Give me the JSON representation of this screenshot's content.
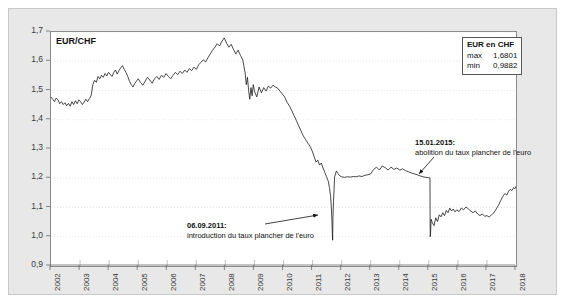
{
  "figure": {
    "series_label": "EUR/CHF",
    "background_panel_color": "#e8e8e8",
    "plot_background_color": "#ffffff",
    "line_color": "#1a1a1a",
    "grid_color": "#d9d9d9"
  },
  "legend": {
    "title": "EUR en CHF",
    "rows": [
      {
        "key": "max",
        "value": "1,6801"
      },
      {
        "key": "min",
        "value": "0,9882"
      }
    ]
  },
  "annotations": [
    {
      "id": "annotation-2011",
      "date": "06.09.2011:",
      "text": "introduction du taux plancher de l'euro"
    },
    {
      "id": "annotation-2015",
      "date": "15.01.2015:",
      "text": "abolition  du taux plancher de l'euro"
    }
  ],
  "chart_data": {
    "type": "line",
    "title": "",
    "subtitle": "",
    "xlabel": "",
    "ylabel": "EUR/CHF",
    "grid": true,
    "legend_position": "top-right",
    "xlim": [
      2002,
      2018
    ],
    "ylim": [
      0.9,
      1.7
    ],
    "ytick_labels": [
      "0,9",
      "1,0",
      "1,1",
      "1,2",
      "1,3",
      "1,4",
      "1,5",
      "1,6",
      "1,7"
    ],
    "ytick_values": [
      0.9,
      1.0,
      1.1,
      1.2,
      1.3,
      1.4,
      1.5,
      1.6,
      1.7
    ],
    "xtick_labels": [
      "2002",
      "2003",
      "2004",
      "2005",
      "2006",
      "2007",
      "2008",
      "2009",
      "2010",
      "2011",
      "2012",
      "2013",
      "2014",
      "2015",
      "2016",
      "2017",
      "2018"
    ],
    "xtick_values": [
      2002,
      2003,
      2004,
      2005,
      2006,
      2007,
      2008,
      2009,
      2010,
      2011,
      2012,
      2013,
      2014,
      2015,
      2016,
      2017,
      2018
    ],
    "series": [
      {
        "name": "EUR en CHF",
        "max": 1.6801,
        "min": 0.9882,
        "x": [
          2002.0,
          2002.06,
          2002.12,
          2002.18,
          2002.24,
          2002.3,
          2002.36,
          2002.42,
          2002.48,
          2002.54,
          2002.6,
          2002.66,
          2002.72,
          2002.78,
          2002.84,
          2002.9,
          2002.96,
          2003.02,
          2003.08,
          2003.14,
          2003.2,
          2003.26,
          2003.32,
          2003.38,
          2003.44,
          2003.5,
          2003.56,
          2003.62,
          2003.68,
          2003.74,
          2003.8,
          2003.86,
          2003.92,
          2003.98,
          2004.04,
          2004.1,
          2004.16,
          2004.22,
          2004.28,
          2004.34,
          2004.4,
          2004.46,
          2004.52,
          2004.58,
          2004.64,
          2004.7,
          2004.76,
          2004.82,
          2004.88,
          2004.94,
          2005.0,
          2005.08,
          2005.16,
          2005.24,
          2005.32,
          2005.4,
          2005.48,
          2005.56,
          2005.64,
          2005.72,
          2005.8,
          2005.88,
          2005.96,
          2006.04,
          2006.12,
          2006.2,
          2006.28,
          2006.36,
          2006.44,
          2006.52,
          2006.6,
          2006.68,
          2006.76,
          2006.84,
          2006.92,
          2007.0,
          2007.08,
          2007.16,
          2007.24,
          2007.32,
          2007.4,
          2007.48,
          2007.56,
          2007.64,
          2007.72,
          2007.8,
          2007.88,
          2007.96,
          2008.04,
          2008.12,
          2008.2,
          2008.28,
          2008.36,
          2008.44,
          2008.52,
          2008.6,
          2008.68,
          2008.72,
          2008.76,
          2008.8,
          2008.84,
          2008.88,
          2008.92,
          2008.96,
          2009.0,
          2009.08,
          2009.16,
          2009.24,
          2009.32,
          2009.4,
          2009.48,
          2009.56,
          2009.64,
          2009.72,
          2009.8,
          2009.88,
          2009.96,
          2010.04,
          2010.12,
          2010.2,
          2010.28,
          2010.36,
          2010.44,
          2010.52,
          2010.6,
          2010.68,
          2010.76,
          2010.84,
          2010.92,
          2011.0,
          2011.06,
          2011.12,
          2011.18,
          2011.24,
          2011.3,
          2011.36,
          2011.42,
          2011.48,
          2011.54,
          2011.58,
          2011.62,
          2011.65,
          2011.67,
          2011.68,
          2011.69,
          2011.7,
          2011.72,
          2011.76,
          2011.82,
          2011.88,
          2011.94,
          2012.0,
          2012.1,
          2012.2,
          2012.3,
          2012.4,
          2012.5,
          2012.6,
          2012.7,
          2012.8,
          2012.9,
          2013.0,
          2013.1,
          2013.2,
          2013.3,
          2013.4,
          2013.5,
          2013.6,
          2013.7,
          2013.8,
          2013.9,
          2014.0,
          2014.1,
          2014.2,
          2014.3,
          2014.4,
          2014.5,
          2014.6,
          2014.7,
          2014.8,
          2014.9,
          2015.0,
          2015.04,
          2015.042,
          2015.045,
          2015.05,
          2015.06,
          2015.08,
          2015.12,
          2015.18,
          2015.24,
          2015.3,
          2015.36,
          2015.42,
          2015.48,
          2015.54,
          2015.6,
          2015.66,
          2015.72,
          2015.78,
          2015.84,
          2015.9,
          2015.96,
          2016.04,
          2016.12,
          2016.2,
          2016.28,
          2016.36,
          2016.44,
          2016.52,
          2016.6,
          2016.68,
          2016.76,
          2016.84,
          2016.92,
          2017.0,
          2017.08,
          2017.16,
          2017.24,
          2017.32,
          2017.4,
          2017.48,
          2017.56,
          2017.62,
          2017.68,
          2017.74,
          2017.8,
          2017.86,
          2017.92,
          2017.96,
          2018.0
        ],
        "y": [
          1.478,
          1.47,
          1.462,
          1.474,
          1.468,
          1.455,
          1.462,
          1.452,
          1.458,
          1.448,
          1.456,
          1.446,
          1.462,
          1.452,
          1.465,
          1.455,
          1.468,
          1.462,
          1.452,
          1.46,
          1.47,
          1.462,
          1.472,
          1.482,
          1.52,
          1.535,
          1.528,
          1.548,
          1.54,
          1.552,
          1.545,
          1.558,
          1.55,
          1.562,
          1.555,
          1.548,
          1.562,
          1.57,
          1.556,
          1.568,
          1.578,
          1.585,
          1.572,
          1.562,
          1.548,
          1.532,
          1.52,
          1.512,
          1.524,
          1.532,
          1.54,
          1.528,
          1.518,
          1.532,
          1.545,
          1.536,
          1.525,
          1.54,
          1.548,
          1.538,
          1.552,
          1.545,
          1.558,
          1.548,
          1.54,
          1.552,
          1.562,
          1.554,
          1.566,
          1.558,
          1.57,
          1.562,
          1.575,
          1.568,
          1.58,
          1.572,
          1.588,
          1.596,
          1.605,
          1.598,
          1.612,
          1.625,
          1.638,
          1.648,
          1.66,
          1.652,
          1.668,
          1.68,
          1.662,
          1.648,
          1.658,
          1.64,
          1.625,
          1.638,
          1.62,
          1.605,
          1.56,
          1.52,
          1.545,
          1.5,
          1.47,
          1.51,
          1.482,
          1.52,
          1.498,
          1.478,
          1.512,
          1.492,
          1.51,
          1.498,
          1.515,
          1.508,
          1.518,
          1.512,
          1.508,
          1.498,
          1.488,
          1.478,
          1.46,
          1.448,
          1.432,
          1.415,
          1.398,
          1.38,
          1.362,
          1.345,
          1.332,
          1.32,
          1.308,
          1.29,
          1.272,
          1.255,
          1.262,
          1.245,
          1.252,
          1.235,
          1.22,
          1.205,
          1.19,
          1.168,
          1.14,
          1.095,
          1.045,
          1.01,
          0.9882,
          1.06,
          1.12,
          1.205,
          1.225,
          1.215,
          1.208,
          1.205,
          1.203,
          1.205,
          1.204,
          1.206,
          1.205,
          1.208,
          1.206,
          1.21,
          1.212,
          1.215,
          1.23,
          1.238,
          1.228,
          1.242,
          1.236,
          1.228,
          1.238,
          1.23,
          1.235,
          1.228,
          1.232,
          1.226,
          1.222,
          1.218,
          1.215,
          1.212,
          1.208,
          1.205,
          1.203,
          1.202,
          1.201,
          1.15,
          1.06,
          1.0,
          1.012,
          1.06,
          1.048,
          1.038,
          1.065,
          1.052,
          1.075,
          1.068,
          1.082,
          1.072,
          1.09,
          1.082,
          1.098,
          1.088,
          1.095,
          1.085,
          1.092,
          1.086,
          1.098,
          1.092,
          1.102,
          1.095,
          1.088,
          1.082,
          1.088,
          1.078,
          1.072,
          1.078,
          1.07,
          1.072,
          1.068,
          1.075,
          1.082,
          1.095,
          1.108,
          1.125,
          1.14,
          1.148,
          1.142,
          1.155,
          1.162,
          1.158,
          1.168,
          1.164,
          1.172
        ]
      }
    ],
    "events": [
      {
        "date": "06.09.2011",
        "label": "introduction du taux plancher de l'euro",
        "x": 2011.68,
        "y": 1.1
      },
      {
        "date": "15.01.2015",
        "label": "abolition  du taux plancher de l'euro",
        "x": 2015.04,
        "y": 1.2
      }
    ]
  }
}
